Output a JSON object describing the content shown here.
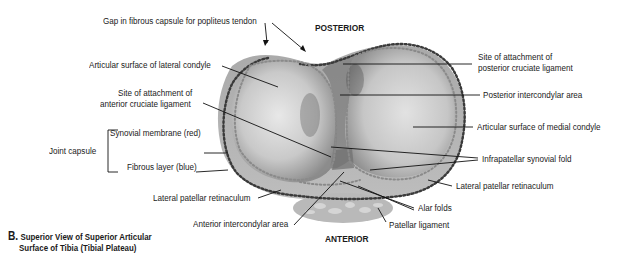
{
  "figure": {
    "caption_letter": "B.",
    "caption_line1": "Superior View of Superior Articular",
    "caption_line2": "Surface of Tibia (Tibial Plateau)"
  },
  "orientation": {
    "posterior": "POSTERIOR",
    "anterior": "ANTERIOR"
  },
  "labels": {
    "gap_fibrous_capsule": "Gap in fibrous capsule for popliteus tendon",
    "articular_lateral_condyle": "Articular surface of lateral condyle",
    "acl_line1": "Site of attachment of",
    "acl_line2": "anterior cruciate ligament",
    "joint_capsule": "Joint capsule",
    "synovial_membrane": "Synovial membrane (red)",
    "fibrous_layer": "Fibrous layer (blue)",
    "lateral_patellar_retinaculum_left": "Lateral patellar retinaculum",
    "anterior_intercondylar_area": "Anterior intercondylar area",
    "pcl_line1": "Site of attachment of",
    "pcl_line2": "posterior cruciate ligament",
    "posterior_intercondylar_area": "Posterior intercondylar area",
    "articular_medial_condyle": "Articular surface of medial condyle",
    "infrapatellar_synovial_fold": "Infrapatellar synovial fold",
    "lateral_patellar_retinaculum_right": "Lateral patellar retinaculum",
    "alar_folds": "Alar folds",
    "patellar_ligament": "Patellar ligament"
  },
  "colors": {
    "text": "#1a1a1a",
    "leader": "#111111",
    "dots": "#555555",
    "plateau_light": "#d6d6d6",
    "plateau_dark": "#8a8a8a"
  }
}
